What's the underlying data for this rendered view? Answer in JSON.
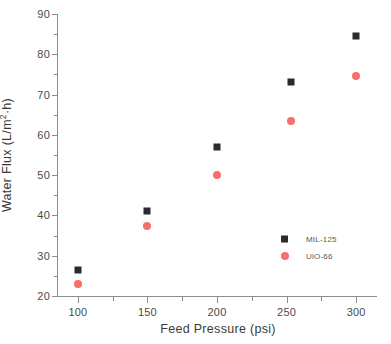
{
  "chart_data": {
    "type": "scatter",
    "title": "",
    "xlabel": "Feed Pressure (psi)",
    "ylabel": "Water Flux (L/m²·h)",
    "ylabel_parts": {
      "pre": "Water Flux (L/m",
      "sup": "2",
      "post": "·h)"
    },
    "xlim": [
      85,
      315
    ],
    "ylim": [
      20,
      90
    ],
    "grid": false,
    "legend_position": "lower-right inside",
    "x": [
      100,
      150,
      200,
      253,
      300
    ],
    "xtick_labels": [
      "100",
      "150",
      "200",
      "250",
      "300"
    ],
    "xticks": [
      100,
      150,
      200,
      250,
      300
    ],
    "xminorticks": [
      125,
      175,
      225,
      275
    ],
    "ytick_labels": [
      "20",
      "30",
      "40",
      "50",
      "60",
      "70",
      "80",
      "90"
    ],
    "yticks": [
      20,
      30,
      40,
      50,
      60,
      70,
      80,
      90
    ],
    "yminorticks": [
      25,
      35,
      45,
      55,
      65,
      75,
      85
    ],
    "series": [
      {
        "name": "MIL-125",
        "marker": "square",
        "color": "#2b2b2b",
        "values": [
          26.5,
          41,
          57,
          73,
          84.5
        ]
      },
      {
        "name": "UiO-66",
        "marker": "circle",
        "color": "#f5706a",
        "values": [
          23,
          37.5,
          50,
          63.5,
          74.5
        ]
      }
    ]
  },
  "legend": {
    "entries": [
      {
        "label": "MIL-125",
        "marker": "square"
      },
      {
        "label": "UiO-66",
        "marker": "circle"
      }
    ]
  },
  "colors": {
    "series_1": "#2b2b2b",
    "series_2": "#f5706a",
    "axis": "#8d8d8d",
    "text": "#4a4a4a",
    "background": "#ffffff"
  }
}
